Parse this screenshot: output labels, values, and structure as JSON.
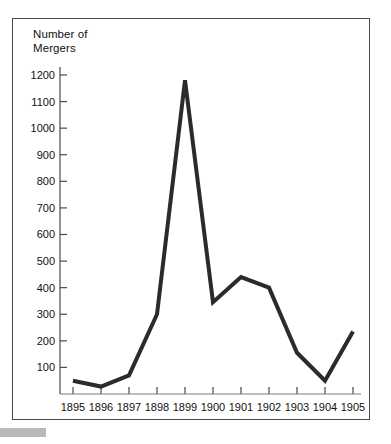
{
  "chart_data": {
    "type": "line",
    "title": "Number of\nMergers",
    "title_lines": [
      "Number of",
      "Mergers"
    ],
    "xlabel": "",
    "ylabel": "Number of Mergers",
    "categories": [
      "1895",
      "1896",
      "1897",
      "1898",
      "1899",
      "1900",
      "1901",
      "1902",
      "1903",
      "1904",
      "1905"
    ],
    "x": [
      1895,
      1896,
      1897,
      1898,
      1899,
      1900,
      1901,
      1902,
      1903,
      1904,
      1905
    ],
    "values": [
      50,
      28,
      70,
      300,
      1180,
      345,
      440,
      400,
      155,
      50,
      235
    ],
    "series": [
      {
        "name": "Number of Mergers",
        "values": [
          50,
          28,
          70,
          300,
          1180,
          345,
          440,
          400,
          155,
          50,
          235
        ]
      }
    ],
    "ylim": [
      0,
      1230
    ],
    "xlim": [
      1894.6,
      1905.6
    ],
    "yticks": [
      100,
      200,
      300,
      400,
      500,
      600,
      700,
      800,
      900,
      1000,
      1100,
      1200
    ],
    "ytick_labels": [
      "100",
      "200",
      "300",
      "400",
      "500",
      "600",
      "700",
      "800",
      "900",
      "1000",
      "1100",
      "1200"
    ],
    "xtick_labels": [
      "1895",
      "1896",
      "1897",
      "1898",
      "1899",
      "1900",
      "1901",
      "1902",
      "1903",
      "1904",
      "1905"
    ],
    "grid": false,
    "legend": false,
    "legend_position": "none",
    "line_color": "#2b2b2b",
    "line_width": 4,
    "markers": false,
    "axis_color": "#4a4a4a",
    "frame_color": "#4a4a4a",
    "background_color": "#ffffff",
    "text_color": "#111111"
  }
}
